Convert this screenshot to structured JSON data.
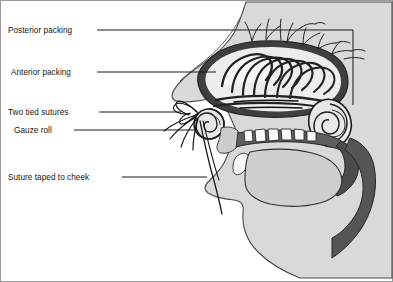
{
  "figure": {
    "background_color": "#ffffff",
    "frame_color": "#7d7d7d",
    "line_color": "#1a1a1a",
    "width": 393,
    "height": 282
  },
  "labels": [
    {
      "id": "posterior-packing",
      "text": "Posterior packing",
      "text_x": 8,
      "text_y": 33,
      "leader": "M 97,30 L 353,30 L 353,105"
    },
    {
      "id": "anterior-packing",
      "text": "Anterior packing",
      "text_x": 11,
      "text_y": 75,
      "leader": "M 97,72 L 216,72"
    },
    {
      "id": "two-tied-sutures",
      "text": "Two tied sutures",
      "text_x": 8,
      "text_y": 115,
      "leader": "M 99,112 L 181,112"
    },
    {
      "id": "gauze-roll",
      "text": "Gauze roll",
      "text_x": 14,
      "text_y": 133,
      "leader": "M 74,130 L 196,130"
    },
    {
      "id": "suture-taped-to-cheek",
      "text": "Suture taped to cheek",
      "text_x": 8,
      "text_y": 180,
      "leader": "M 122,177 L 207,177"
    }
  ],
  "anatomy": {
    "skin_fill": "#d6d6d6",
    "skin_stroke": "#3a3a3a",
    "mucosa_fill": "#6e6e6e",
    "mucosa_dark_fill": "#4a4a4a",
    "cavity_fill": "#f2f2f2",
    "gauze_fill": "#f4f4f4",
    "gauze_stroke": "#2b2b2b",
    "tooth_fill": "#fbfbfb",
    "tongue_fill": "#cfcfcf",
    "vessel_stroke": "#232323",
    "parts": [
      "forehead-profile",
      "nose-profile",
      "upper-lip",
      "lower-lip",
      "chin",
      "jaw",
      "neck",
      "nasal-cavity",
      "anterior-packing-gauze",
      "posterior-packing-roll",
      "gauze-roll-nostril",
      "suture-threads",
      "hard-palate",
      "soft-palate",
      "tongue",
      "teeth",
      "pharynx",
      "blood-vessels"
    ]
  }
}
